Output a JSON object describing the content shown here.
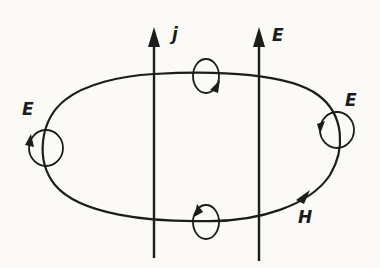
{
  "diagram": {
    "title": "",
    "ink_color": "#1c1c1c",
    "background": "#fbfaf6",
    "labels": {
      "current_arrow": "j",
      "field_arrow": "E",
      "left_loop": "E",
      "right_loop": "E",
      "main_loop": "H"
    },
    "elements": [
      {
        "id": "current-arrow",
        "type": "vertical-arrow",
        "label": "j",
        "direction": "up"
      },
      {
        "id": "field-arrow",
        "type": "vertical-arrow",
        "label": "E",
        "direction": "up"
      },
      {
        "id": "h-loop",
        "type": "closed-loop",
        "label": "H",
        "direction": "clockwise-arrow-at-lower-right"
      },
      {
        "id": "loop-left",
        "type": "small-circulation",
        "label": "E"
      },
      {
        "id": "loop-right",
        "type": "small-circulation",
        "label": "E"
      },
      {
        "id": "loop-top",
        "type": "small-circulation",
        "label": ""
      },
      {
        "id": "loop-bottom",
        "type": "small-circulation",
        "label": ""
      }
    ]
  }
}
